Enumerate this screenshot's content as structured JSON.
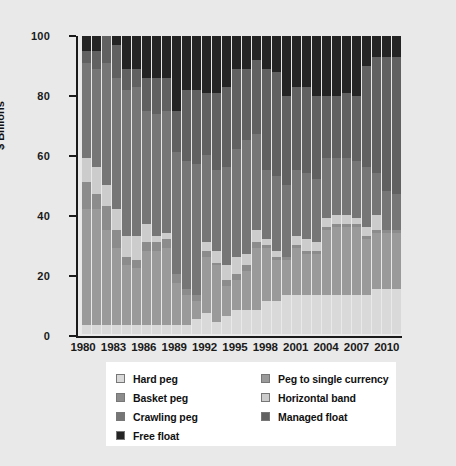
{
  "chart_data": {
    "type": "bar",
    "stacked": true,
    "normalized": true,
    "title": "",
    "subtitle": "",
    "xlabel": "",
    "ylabel": "$ Billions",
    "ylim": [
      0,
      100
    ],
    "yticks": [
      0,
      20,
      40,
      60,
      80,
      100
    ],
    "grid": false,
    "legend_position": "bottom",
    "categories": [
      "1980",
      "1981",
      "1982",
      "1983",
      "1984",
      "1985",
      "1986",
      "1987",
      "1988",
      "1989",
      "1990",
      "1991",
      "1992",
      "1993",
      "1994",
      "1995",
      "1996",
      "1997",
      "1998",
      "1999",
      "2000",
      "2001",
      "2002",
      "2003",
      "2004",
      "2005",
      "2006",
      "2007",
      "2008",
      "2009",
      "2010",
      "2011"
    ],
    "xtick_labels": [
      "1980",
      "1983",
      "1986",
      "1989",
      "1992",
      "1995",
      "1998",
      "2001",
      "2004",
      "2007",
      "2010"
    ],
    "xtick_categories": [
      "1980",
      "1983",
      "1986",
      "1989",
      "1992",
      "1995",
      "1998",
      "2001",
      "2004",
      "2007",
      "2010"
    ],
    "series": [
      {
        "name": "Hard peg",
        "color": "#d9d9d9",
        "values": [
          3,
          3,
          3,
          3,
          3,
          3,
          3,
          3,
          3,
          3,
          3,
          5,
          7,
          4,
          6,
          8,
          8,
          8,
          11,
          11,
          13,
          13,
          13,
          13,
          13,
          13,
          13,
          13,
          13,
          15,
          15,
          15
        ]
      },
      {
        "name": "Peg to single currency",
        "color": "#9a9a9a",
        "values": [
          39,
          39,
          32,
          26,
          20,
          19,
          25,
          25,
          26,
          14,
          10,
          6,
          19,
          19,
          10,
          10,
          13,
          21,
          18,
          14,
          12,
          16,
          14,
          14,
          22,
          23,
          23,
          23,
          19,
          19,
          19,
          19
        ]
      },
      {
        "name": "Basket peg",
        "color": "#8c8c8c",
        "values": [
          9,
          5,
          8,
          6,
          3,
          3,
          3,
          3,
          3,
          3,
          2,
          2,
          2,
          1,
          2,
          2,
          2,
          2,
          1,
          1,
          1,
          1,
          1,
          1,
          1,
          1,
          1,
          1,
          1,
          1,
          1,
          1
        ]
      },
      {
        "name": "Horizontal band",
        "color": "#cccccc",
        "values": [
          8,
          9,
          7,
          7,
          7,
          8,
          6,
          2,
          2,
          0,
          0,
          0,
          3,
          4,
          5,
          6,
          4,
          4,
          2,
          2,
          0,
          3,
          4,
          3,
          3,
          3,
          3,
          2,
          3,
          5,
          0,
          0
        ]
      },
      {
        "name": "Crawling peg",
        "color": "#767676",
        "values": [
          32,
          33,
          41,
          44,
          49,
          50,
          38,
          41,
          41,
          41,
          43,
          44,
          29,
          27,
          33,
          36,
          38,
          32,
          23,
          25,
          24,
          22,
          22,
          21,
          20,
          19,
          19,
          19,
          20,
          14,
          13,
          12
        ]
      },
      {
        "name": "Managed float",
        "color": "#616161",
        "values": [
          4,
          6,
          9,
          11,
          7,
          6,
          11,
          12,
          11,
          14,
          24,
          25,
          21,
          26,
          27,
          27,
          24,
          25,
          34,
          35,
          30,
          28,
          29,
          28,
          21,
          21,
          22,
          22,
          34,
          39,
          45,
          46
        ]
      },
      {
        "name": "Free float",
        "color": "#242424",
        "values": [
          5,
          5,
          0,
          3,
          11,
          11,
          14,
          14,
          14,
          25,
          18,
          18,
          19,
          19,
          17,
          11,
          11,
          8,
          11,
          12,
          20,
          17,
          17,
          20,
          20,
          20,
          19,
          20,
          10,
          7,
          7,
          7
        ]
      }
    ],
    "legend_entries": [
      {
        "label": "Hard peg",
        "color": "#d9d9d9"
      },
      {
        "label": "Basket peg",
        "color": "#8c8c8c"
      },
      {
        "label": "Crawling peg",
        "color": "#767676"
      },
      {
        "label": "Free float",
        "color": "#242424"
      },
      {
        "label": "Peg to single currency",
        "color": "#9a9a9a"
      },
      {
        "label": "Horizontal band",
        "color": "#cccccc"
      },
      {
        "label": "Managed float",
        "color": "#616161"
      }
    ]
  },
  "legend": {
    "left_column": [
      {
        "label": "Hard peg",
        "color": "#d9d9d9",
        "name": "hard-peg"
      },
      {
        "label": "Basket peg",
        "color": "#8c8c8c",
        "name": "basket-peg"
      },
      {
        "label": "Crawling peg",
        "color": "#767676",
        "name": "crawling-peg"
      },
      {
        "label": "Free float",
        "color": "#242424",
        "name": "free-float"
      }
    ],
    "right_column": [
      {
        "label": "Peg to single currency",
        "color": "#9a9a9a",
        "name": "peg-to-single-currency"
      },
      {
        "label": "Horizontal band",
        "color": "#cccccc",
        "name": "horizontal-band"
      },
      {
        "label": "Managed float",
        "color": "#616161",
        "name": "managed-float"
      }
    ]
  }
}
